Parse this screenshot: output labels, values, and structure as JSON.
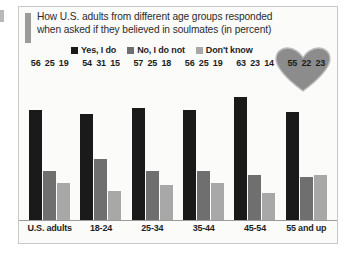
{
  "figure": {
    "edge_mark": "left-edge-tick",
    "heart_icon": "heart-icon",
    "heart_color": "#8c8c8c"
  },
  "title": {
    "line1": "How U.S. adults from different age groups responded",
    "line2": "when asked if they believed in soulmates (in percent)"
  },
  "chart_data": {
    "type": "bar",
    "title": "How U.S. adults from different age groups responded when asked if they believed in soulmates (in percent)",
    "xlabel": "",
    "ylabel": "",
    "ylim": [
      0,
      70
    ],
    "grid": false,
    "legend_position": "top",
    "categories": [
      "U.S. adults",
      "18-24",
      "25-34",
      "35-44",
      "45-54",
      "55 and up"
    ],
    "series": [
      {
        "name": "Yes, I do",
        "color": "#1a1a1a",
        "values": [
          56,
          54,
          57,
          56,
          63,
          55
        ]
      },
      {
        "name": "No, I do not",
        "color": "#6f6f6f",
        "values": [
          25,
          31,
          25,
          25,
          23,
          22
        ]
      },
      {
        "name": "Don't know",
        "color": "#a8a8a8",
        "values": [
          19,
          15,
          18,
          19,
          14,
          23
        ]
      }
    ]
  }
}
